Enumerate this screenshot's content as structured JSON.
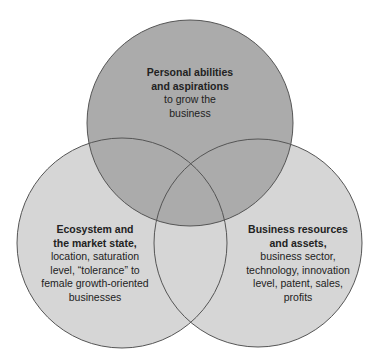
{
  "diagram": {
    "type": "venn",
    "colors": {
      "background": "#ffffff",
      "circle_fill_light": "#d6d6d6",
      "circle_fill_dark": "#ababab",
      "outline": "#555555",
      "text": "#222222"
    },
    "circles": [
      {
        "id": "personal",
        "cx": 190,
        "cy": 123,
        "r": 103,
        "title": "Personal abilities and aspirations",
        "title_lines": [
          "Personal abilities",
          "and aspirations"
        ],
        "body_lines": [
          "to grow the",
          "business"
        ]
      },
      {
        "id": "ecosystem",
        "cx": 122,
        "cy": 243,
        "r": 105,
        "title": "Ecosystem and the market state,",
        "title_lines": [
          "Ecosystem and",
          "the market state,"
        ],
        "body_lines": [
          "location, saturation",
          "level, “tolerance” to",
          "female growth-oriented",
          "businesses"
        ]
      },
      {
        "id": "resources",
        "cx": 258,
        "cy": 243,
        "r": 104,
        "title": "Business resources and assets,",
        "title_lines": [
          "Business resources",
          "and assets,"
        ],
        "body_lines": [
          "business sector,",
          "technology, innovation",
          "level, patent, sales,",
          "profits"
        ]
      }
    ]
  }
}
